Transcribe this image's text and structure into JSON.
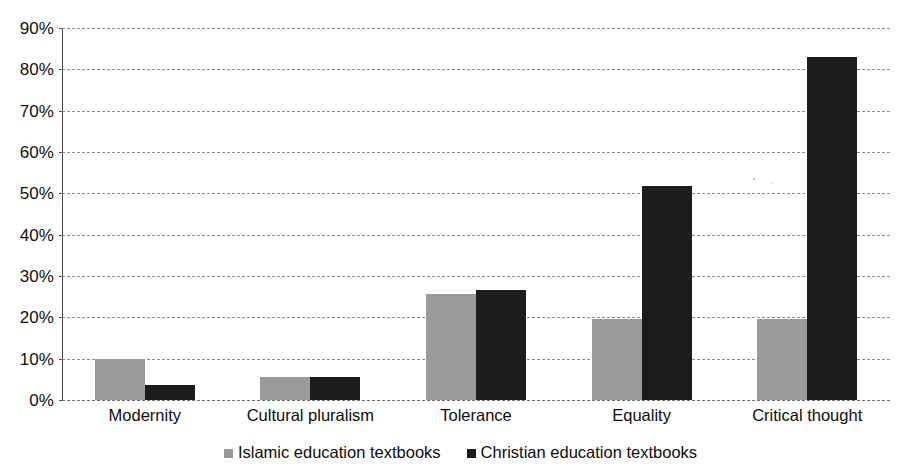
{
  "chart_data": {
    "type": "bar",
    "title": "",
    "subtitle": "",
    "xlabel": "",
    "ylabel": "",
    "categories": [
      "Modernity",
      "Cultural pluralism",
      "Tolerance",
      "Equality",
      "Critical thought"
    ],
    "series": [
      {
        "name": "Islamic education textbooks",
        "color": "#9a9a9a",
        "values": [
          10.0,
          5.6,
          25.7,
          19.6,
          19.6
        ]
      },
      {
        "name": "Christian education textbooks",
        "color": "#1c1c1c",
        "values": [
          3.7,
          5.6,
          26.5,
          51.7,
          83.0
        ]
      }
    ],
    "ylim": [
      0,
      90
    ],
    "ytick_values": [
      0,
      10,
      20,
      30,
      40,
      50,
      60,
      70,
      80,
      90
    ],
    "ytick_labels": [
      "0%",
      "10%",
      "20%",
      "30%",
      "40%",
      "50%",
      "60%",
      "70%",
      "80%",
      "90%"
    ],
    "value_suffix": "%",
    "grid": true,
    "grid_style": "dashed-horizontal",
    "legend_position": "bottom-center",
    "orientation": "vertical",
    "bar_group_mode": "grouped"
  },
  "legend": {
    "items": [
      {
        "label": "Islamic education textbooks",
        "swatch": "legend-swatch-gray"
      },
      {
        "label": "Christian education textbooks",
        "swatch": "legend-swatch-black"
      }
    ]
  }
}
